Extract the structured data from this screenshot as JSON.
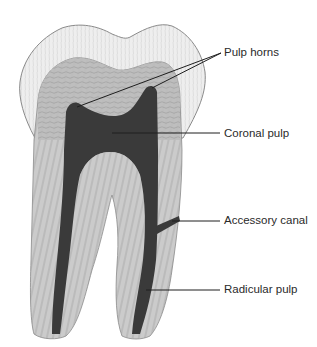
{
  "figure": {
    "colors": {
      "background": "#ffffff",
      "enamel": "#ececec",
      "enamel_outline": "#8a8a8a",
      "dentin": "#bdbdbd",
      "dentin_dark": "#a8a8a8",
      "root": "#c9c9c9",
      "pulp": "#3a3a3a",
      "leader": "#1e1e1e",
      "texture": "#7a7a7a"
    }
  },
  "labels": [
    {
      "id": "pulp-horns",
      "text": "Pulp horns",
      "x": 224,
      "y": 47
    },
    {
      "id": "coronal-pulp",
      "text": "Coronal pulp",
      "x": 224,
      "y": 128
    },
    {
      "id": "accessory-canal",
      "text": "Accessory canal",
      "x": 224,
      "y": 215
    },
    {
      "id": "radicular-pulp",
      "text": "Radicular pulp",
      "x": 224,
      "y": 284
    }
  ]
}
